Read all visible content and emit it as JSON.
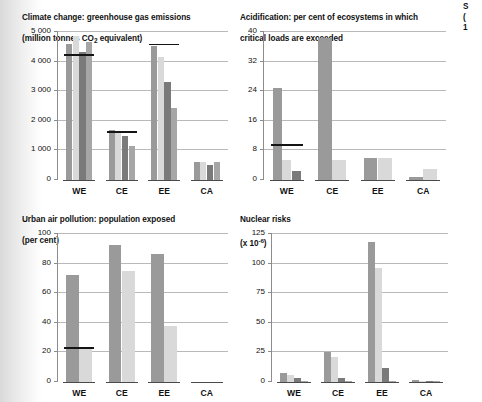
{
  "figure": {
    "background": "#ffffff",
    "series_colors": [
      "#9a9a9a",
      "#d9d9d9",
      "#7a7a7a",
      "#a6a6a6"
    ],
    "refline_color": "#141414",
    "gridline_color": "#b9b9b9",
    "axis_color": "#8c8c8c",
    "categories": [
      "WE",
      "CE",
      "EE",
      "CA"
    ]
  },
  "panels": [
    {
      "id": "climate-change",
      "title_line1": "Climate change: greenhouse gas emissions",
      "title_line2_pre": "(million tonnes CO",
      "title_line2_sub": "2",
      "title_line2_post": " equivalent)"
    },
    {
      "id": "acidification",
      "title_line1": "Acidification: per cent of ecosystems in which",
      "title_line2": "critical loads are exceeded"
    },
    {
      "id": "urban-air-pollution",
      "title_line1": "Urban air pollution: population exposed",
      "title_line2": "(per cent)"
    },
    {
      "id": "nuclear-risks",
      "title_line1": "Nuclear risks",
      "title_line2_pre": "(x 10",
      "title_line2_sup": "-6",
      "title_line2_post": ")"
    },
    {
      "id": "clipped-right-panel",
      "title_clipped": "S\n(\n1"
    }
  ],
  "chart_data": [
    {
      "type": "bar",
      "id": "climate-change",
      "title": "Climate change: greenhouse gas emissions (million tonnes CO2 equivalent)",
      "xlabel": "",
      "ylabel": "",
      "ylim": [
        0,
        5000
      ],
      "yticks": [
        0,
        1000,
        2000,
        3000,
        4000,
        5000
      ],
      "ytick_labels": [
        "0",
        "1 000",
        "2 000",
        "3 000",
        "4 000",
        "5 000"
      ],
      "grid": true,
      "categories": [
        "WE",
        "CE",
        "EE",
        "CA"
      ],
      "series": [
        {
          "name": "scenario-1",
          "values": [
            4600,
            1680,
            4540,
            620
          ]
        },
        {
          "name": "scenario-2",
          "values": [
            4860,
            1670,
            4150,
            620
          ]
        },
        {
          "name": "scenario-3",
          "values": [
            4330,
            1490,
            3310,
            500
          ]
        },
        {
          "name": "scenario-4",
          "values": [
            4660,
            1160,
            2420,
            610
          ]
        }
      ],
      "reference_lines": [
        {
          "category": "WE",
          "value": 4190
        },
        {
          "category": "CE",
          "value": 1590
        },
        {
          "category": "EE",
          "value": 4550
        },
        {
          "category": "CA",
          "value": null
        }
      ]
    },
    {
      "type": "bar",
      "id": "acidification",
      "title": "Acidification: per cent of ecosystems in which critical loads are exceeded",
      "xlabel": "",
      "ylabel": "",
      "ylim": [
        0,
        40
      ],
      "yticks": [
        0,
        8,
        16,
        24,
        32,
        40
      ],
      "ytick_labels": [
        "0",
        "8",
        "16",
        "24",
        "32",
        "40"
      ],
      "grid": true,
      "categories": [
        "WE",
        "CE",
        "EE",
        "CA"
      ],
      "series": [
        {
          "name": "scenario-1",
          "values": [
            25.0,
            38.5,
            6.0,
            0.7
          ]
        },
        {
          "name": "scenario-2",
          "values": [
            5.5,
            5.5,
            5.9,
            3.0
          ]
        },
        {
          "name": "scenario-3",
          "values": [
            2.5,
            0.0,
            0.0,
            0.0
          ]
        },
        {
          "name": "scenario-4",
          "values": [
            0.0,
            0.0,
            0.0,
            0.0
          ]
        }
      ],
      "reference_lines": [
        {
          "category": "WE",
          "value": 9.2
        },
        {
          "category": "CE",
          "value": null
        },
        {
          "category": "EE",
          "value": null
        },
        {
          "category": "CA",
          "value": null
        }
      ]
    },
    {
      "type": "bar",
      "id": "urban-air-pollution",
      "title": "Urban air pollution: population exposed (per cent)",
      "xlabel": "",
      "ylabel": "",
      "ylim": [
        0,
        100
      ],
      "yticks": [
        0,
        20,
        40,
        60,
        80,
        100
      ],
      "ytick_labels": [
        "0",
        "20",
        "40",
        "60",
        "80",
        "100"
      ],
      "grid": true,
      "categories": [
        "WE",
        "CE",
        "EE",
        "CA"
      ],
      "series": [
        {
          "name": "scenario-1",
          "values": [
            72.5,
            92.5,
            86.5,
            0.0
          ]
        },
        {
          "name": "scenario-2",
          "values": [
            23.0,
            75.0,
            38.0,
            0.0
          ]
        },
        {
          "name": "scenario-3",
          "values": [
            0.0,
            0.0,
            0.0,
            0.0
          ]
        },
        {
          "name": "scenario-4",
          "values": [
            0.0,
            0.0,
            0.0,
            0.0
          ]
        }
      ],
      "reference_lines": [
        {
          "category": "WE",
          "value": 22.5
        },
        {
          "category": "CE",
          "value": null
        },
        {
          "category": "EE",
          "value": null
        },
        {
          "category": "CA",
          "value": null
        }
      ]
    },
    {
      "type": "bar",
      "id": "nuclear-risks",
      "title": "Nuclear risks (x 10-6)",
      "xlabel": "",
      "ylabel": "",
      "ylim": [
        0,
        125
      ],
      "yticks": [
        0,
        25,
        50,
        75,
        100,
        125
      ],
      "ytick_labels": [
        "0",
        "25",
        "50",
        "75",
        "100",
        "125"
      ],
      "grid": true,
      "categories": [
        "WE",
        "CE",
        "EE",
        "CA"
      ],
      "series": [
        {
          "name": "scenario-1",
          "values": [
            8.0,
            25.0,
            118.0,
            1.5
          ]
        },
        {
          "name": "scenario-2",
          "values": [
            6.0,
            21.0,
            96.5,
            0.6
          ]
        },
        {
          "name": "scenario-3",
          "values": [
            3.0,
            3.0,
            12.0,
            0.4
          ]
        },
        {
          "name": "scenario-4",
          "values": [
            0.8,
            0.6,
            0.6,
            0.3
          ]
        }
      ],
      "reference_lines": [
        {
          "category": "WE",
          "value": null
        },
        {
          "category": "CE",
          "value": null
        },
        {
          "category": "EE",
          "value": null
        },
        {
          "category": "CA",
          "value": null
        }
      ]
    }
  ]
}
